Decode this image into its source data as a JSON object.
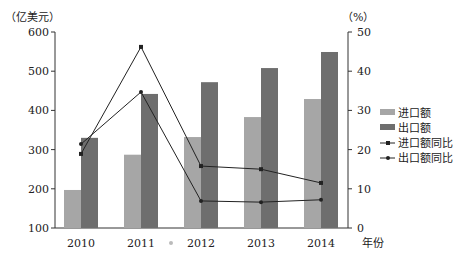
{
  "chart_data": {
    "type": "bar+line",
    "title": "",
    "categories": [
      "2010",
      "2011",
      "2012",
      "2013",
      "2014"
    ],
    "xlabel": "年份",
    "ylabel_left": "（亿美元）",
    "ylabel_right": "（%）",
    "ylim_left": [
      100,
      600
    ],
    "ylim_right": [
      0,
      50
    ],
    "yticks_left": [
      100,
      200,
      300,
      400,
      500,
      600
    ],
    "yticks_right": [
      0,
      10,
      20,
      30,
      40,
      50
    ],
    "grid": false,
    "legend_position": "right",
    "series": [
      {
        "name": "进口额",
        "type": "bar",
        "axis": "left",
        "color": "#a6a6a6",
        "values": [
          197,
          287,
          332,
          383,
          429
        ]
      },
      {
        "name": "出口额",
        "type": "bar",
        "axis": "left",
        "color": "#6e6e6e",
        "values": [
          330,
          442,
          472,
          508,
          549
        ]
      },
      {
        "name": "进口额同比",
        "type": "line",
        "axis": "right",
        "color": "#222222",
        "marker": "square",
        "values": [
          18.9,
          46.2,
          15.8,
          15.0,
          11.5
        ]
      },
      {
        "name": "出口额同比",
        "type": "line",
        "axis": "right",
        "color": "#222222",
        "marker": "circle",
        "values": [
          21.4,
          34.7,
          6.9,
          6.6,
          7.2
        ]
      }
    ]
  }
}
